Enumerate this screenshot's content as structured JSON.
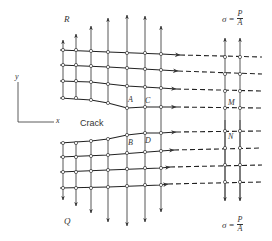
{
  "diagram": {
    "title": "",
    "labels": {
      "top_left_force": "R",
      "bottom_left_force": "Q",
      "crack": "Crack",
      "axis_x": "x",
      "axis_y": "y",
      "point_a": "A",
      "point_b": "B",
      "point_c": "C",
      "point_d": "D",
      "point_m": "M",
      "point_n": "N"
    },
    "stress_top": {
      "symbol": "σ",
      "equals": "=",
      "numerator": "P",
      "denominator": "A"
    },
    "stress_bottom": {
      "symbol": "σ",
      "equals": "=",
      "numerator": "P",
      "denominator": "A"
    },
    "colors": {
      "line": "#333333",
      "node_fill": "#ffffff",
      "background": "#ffffff"
    }
  }
}
